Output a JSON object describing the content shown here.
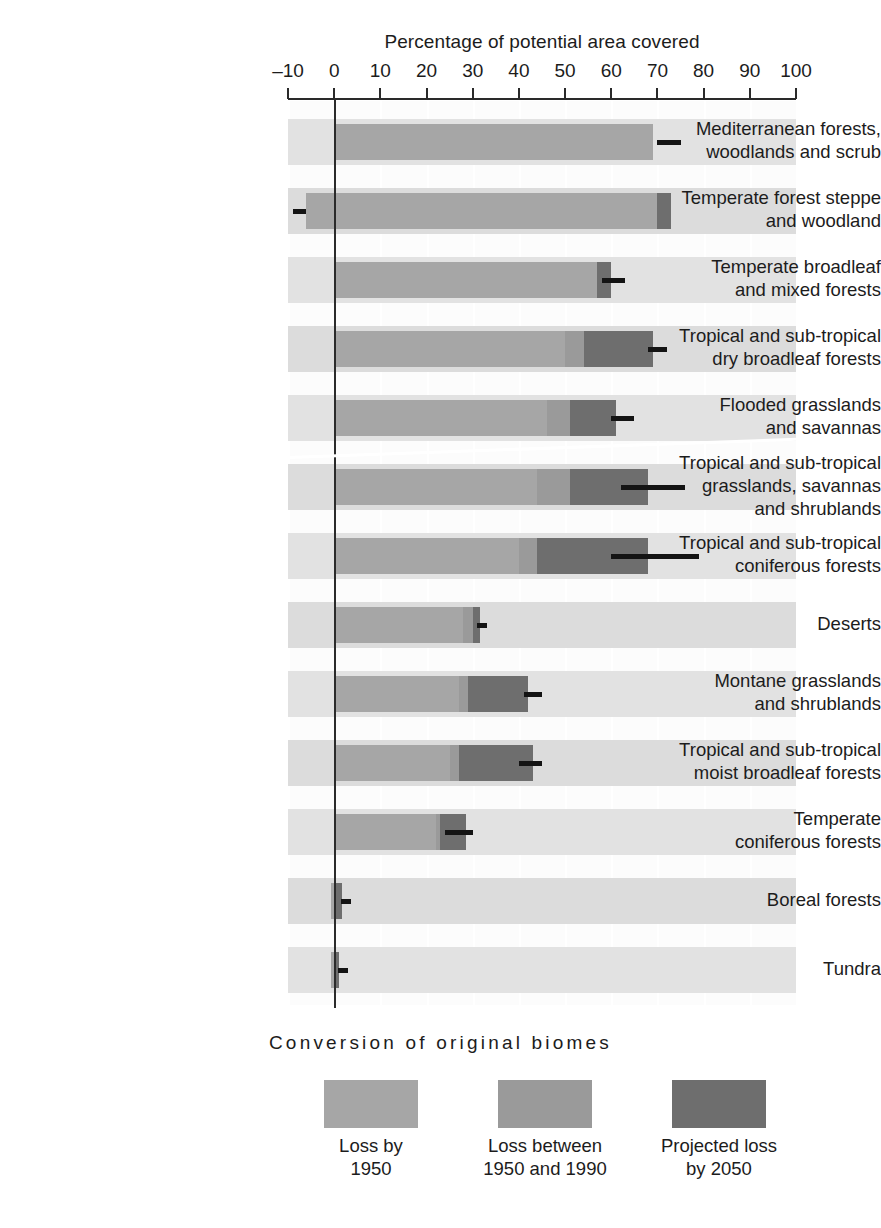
{
  "chart_data": {
    "type": "bar",
    "orientation": "horizontal",
    "stacked": true,
    "title": "Percentage of potential area covered",
    "xlabel": "Percentage of potential area covered",
    "ylabel": "",
    "xlim": [
      -10,
      100
    ],
    "xticks": [
      -10,
      0,
      10,
      20,
      30,
      40,
      50,
      60,
      70,
      80,
      90,
      100
    ],
    "xtick_labels": [
      "–10",
      "0",
      "10",
      "20",
      "30",
      "40",
      "50",
      "60",
      "70",
      "80",
      "90",
      "100"
    ],
    "grid": "vertical white gridlines on banded gray rows",
    "legend_position": "bottom",
    "legend_title": "Conversion of original biomes",
    "series": [
      {
        "name": "Loss by 1950",
        "color": "#a6a6a6"
      },
      {
        "name": "Loss between 1950 and 1990",
        "color": "#9a9a9a"
      },
      {
        "name": "Projected loss by 2050",
        "color": "#6e6e6e"
      }
    ],
    "categories": [
      "Mediterranean forests, woodlands and scrub",
      "Temperate forest steppe and woodland",
      "Temperate broadleaf and mixed forests",
      "Tropical and sub-tropical dry broadleaf forests",
      "Flooded grasslands and savannas",
      "Tropical and sub-tropical grasslands, savannas and shrublands",
      "Tropical and sub-tropical coniferous forests",
      "Deserts",
      "Montane grasslands and shrublands",
      "Tropical and sub-tropical moist broadleaf forests",
      "Temperate coniferous forests",
      "Boreal forests",
      "Tundra"
    ],
    "rows": [
      {
        "label_line1": "Mediterranean forests,",
        "label_line2": "woodlands and scrub",
        "label_line3": "",
        "start": 0,
        "loss_1950_end": 69,
        "loss_5090_end": 69,
        "proj_2050_end": 69,
        "marker": 70,
        "marker_to": 75
      },
      {
        "label_line1": "Temperate forest steppe",
        "label_line2": "and woodland",
        "label_line3": "",
        "start": -6,
        "loss_1950_end": 70,
        "loss_5090_end": 70,
        "proj_2050_end": 73,
        "marker": -9,
        "marker_to": -6
      },
      {
        "label_line1": "Temperate broadleaf",
        "label_line2": "and mixed forests",
        "label_line3": "",
        "start": 0,
        "loss_1950_end": 57,
        "loss_5090_end": 57,
        "proj_2050_end": 60,
        "marker": 58,
        "marker_to": 63
      },
      {
        "label_line1": "Tropical and sub-tropical",
        "label_line2": "dry broadleaf forests",
        "label_line3": "",
        "start": 0,
        "loss_1950_end": 50,
        "loss_5090_end": 54,
        "proj_2050_end": 69,
        "marker": 68,
        "marker_to": 72
      },
      {
        "label_line1": "Flooded grasslands",
        "label_line2": "and savannas",
        "label_line3": "",
        "start": 0,
        "loss_1950_end": 46,
        "loss_5090_end": 51,
        "proj_2050_end": 61,
        "marker": 60,
        "marker_to": 65
      },
      {
        "label_line1": "Tropical and sub-tropical",
        "label_line2": "grasslands, savannas",
        "label_line3": "and shrublands",
        "start": 0,
        "loss_1950_end": 44,
        "loss_5090_end": 51,
        "proj_2050_end": 68,
        "marker": 62,
        "marker_to": 76
      },
      {
        "label_line1": "Tropical and sub-tropical",
        "label_line2": "coniferous forests",
        "label_line3": "",
        "start": 0,
        "loss_1950_end": 40,
        "loss_5090_end": 44,
        "proj_2050_end": 68,
        "marker": 60,
        "marker_to": 79
      },
      {
        "label_line1": "Deserts",
        "label_line2": "",
        "label_line3": "",
        "start": 0,
        "loss_1950_end": 28,
        "loss_5090_end": 30,
        "proj_2050_end": 31.5,
        "marker": 31,
        "marker_to": 33
      },
      {
        "label_line1": "Montane grasslands",
        "label_line2": "and shrublands",
        "label_line3": "",
        "start": 0,
        "loss_1950_end": 27,
        "loss_5090_end": 29,
        "proj_2050_end": 42,
        "marker": 41,
        "marker_to": 45
      },
      {
        "label_line1": "Tropical and sub-tropical",
        "label_line2": "moist broadleaf forests",
        "label_line3": "",
        "start": 0,
        "loss_1950_end": 25,
        "loss_5090_end": 27,
        "proj_2050_end": 43,
        "marker": 40,
        "marker_to": 45
      },
      {
        "label_line1": "Temperate",
        "label_line2": "coniferous forests",
        "label_line3": "",
        "start": 0,
        "loss_1950_end": 22,
        "loss_5090_end": 23,
        "proj_2050_end": 28.5,
        "marker": 24,
        "marker_to": 30
      },
      {
        "label_line1": "Boreal forests",
        "label_line2": "",
        "label_line3": "",
        "start": -0.6,
        "loss_1950_end": 0,
        "loss_5090_end": 0,
        "proj_2050_end": 1.8,
        "marker": 1.5,
        "marker_to": 3
      },
      {
        "label_line1": "Tundra",
        "label_line2": "",
        "label_line3": "",
        "start": -0.6,
        "loss_1950_end": 0,
        "loss_5090_end": 0,
        "proj_2050_end": 1.0,
        "marker": 0.8,
        "marker_to": 3
      }
    ]
  },
  "legend": {
    "title": "Conversion of original biomes",
    "items": [
      {
        "label_line1": "Loss by",
        "label_line2": "1950",
        "color": "#a6a6a6"
      },
      {
        "label_line1": "Loss between",
        "label_line2": "1950 and 1990",
        "color": "#9a9a9a"
      },
      {
        "label_line1": "Projected loss",
        "label_line2": "by 2050",
        "color": "#6e6e6e"
      }
    ]
  },
  "colors": {
    "loss_by_1950": "#a6a6a6",
    "loss_1950_1990": "#9a9a9a",
    "projected_loss_2050": "#6e6e6e",
    "band_light": "#e2e2e2",
    "band_dark": "#dcdcdc",
    "axis": "#2b2b2b",
    "marker": "#141414"
  }
}
